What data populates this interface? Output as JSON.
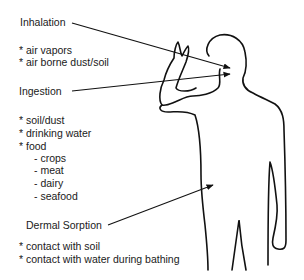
{
  "routes": [
    {
      "label": "Inhalation",
      "items": [
        "* air vapors",
        "* air borne dust/soil"
      ],
      "subitems": []
    },
    {
      "label": "Ingestion",
      "items": [
        "* soil/dust",
        "* drinking water",
        "* food"
      ],
      "subitems": [
        "- crops",
        "- meat",
        "- dairy",
        "- seafood"
      ]
    },
    {
      "label": "Dermal Sorption",
      "items": [
        "* contact with soil",
        "* contact with water during bathing"
      ],
      "subitems": []
    }
  ],
  "colors": {
    "stroke": "#111111",
    "text": "#1a1a1a",
    "background": "#ffffff"
  }
}
